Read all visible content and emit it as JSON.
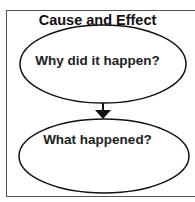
{
  "diagram": {
    "title": "Cause and Effect",
    "nodes": [
      {
        "id": "cause",
        "label": "Why did it happen?",
        "shape": "ellipse"
      },
      {
        "id": "effect",
        "label": "What happened?",
        "shape": "ellipse"
      }
    ],
    "edges": [
      {
        "from": "cause",
        "to": "effect",
        "type": "arrow"
      }
    ],
    "colors": {
      "stroke": "#111111",
      "border": "#555555",
      "text": "#222222"
    }
  }
}
